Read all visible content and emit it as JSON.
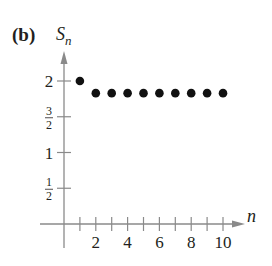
{
  "panel": {
    "label": "(b)"
  },
  "axes": {
    "y_label_main": "S",
    "y_label_sub": "n",
    "x_label": "n",
    "y_ticks": [
      {
        "value": 2,
        "text": "2",
        "kind": "int"
      },
      {
        "value": 1.5,
        "num": "3",
        "den": "2",
        "kind": "frac"
      },
      {
        "value": 1,
        "text": "1",
        "kind": "int"
      },
      {
        "value": 0.5,
        "num": "1",
        "den": "2",
        "kind": "frac"
      }
    ],
    "x_ticks": [
      1,
      2,
      3,
      4,
      5,
      6,
      7,
      8,
      9,
      10
    ],
    "x_tick_labels": [
      "2",
      "4",
      "6",
      "8",
      "10"
    ]
  },
  "colors": {
    "axis": "#8a8a8a",
    "text": "#231f20",
    "point": "#111111"
  },
  "chart_data": {
    "type": "scatter",
    "title": "(b)",
    "xlabel": "n",
    "ylabel": "S_n",
    "x": [
      1,
      2,
      3,
      4,
      5,
      6,
      7,
      8,
      9,
      10
    ],
    "y": [
      2,
      1.83,
      1.83,
      1.83,
      1.83,
      1.83,
      1.83,
      1.83,
      1.83,
      1.83
    ],
    "xlim": [
      0,
      11
    ],
    "ylim": [
      0,
      2.4
    ],
    "x_tick_labels": [
      "2",
      "4",
      "6",
      "8",
      "10"
    ],
    "y_tick_labels": [
      "1/2",
      "1",
      "3/2",
      "2"
    ],
    "grid": false,
    "legend": null
  }
}
